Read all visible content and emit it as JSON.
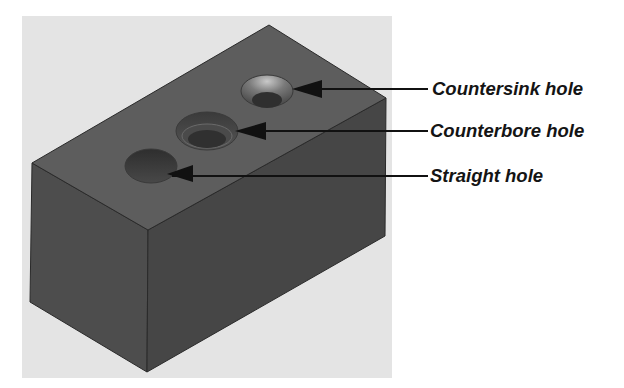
{
  "figure": {
    "background_color": "#e6e6e6",
    "block_colors": {
      "top_face": "#5c5c5c",
      "left_face": "#4c4c4c",
      "right_face": "#454545",
      "edge": "#2a2a2a"
    }
  },
  "callouts": [
    {
      "id": "countersink",
      "label": "Countersink hole",
      "line_y": 89
    },
    {
      "id": "counterbore",
      "label": "Counterbore hole",
      "line_y": 131
    },
    {
      "id": "straight",
      "label": "Straight hole",
      "line_y": 176
    }
  ]
}
